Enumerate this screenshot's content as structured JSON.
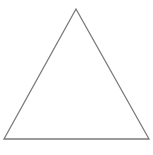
{
  "diagram": {
    "shape": "triangle",
    "type": "equilateral-outline",
    "vertices": {
      "apex": [
        76,
        9
      ],
      "bottom_left": [
        4,
        139
      ],
      "bottom_right": [
        149,
        139
      ]
    },
    "stroke_color": "#7a7a7a",
    "fill_color": "none",
    "background_color": "#ffffff",
    "stroke_width": 1.3
  }
}
